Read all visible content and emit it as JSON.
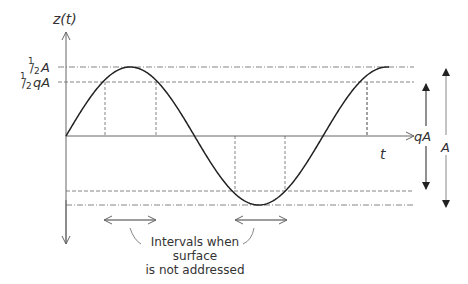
{
  "diagram": {
    "y_axis_label": "z(t)",
    "x_axis_label": "t",
    "half_a_label": {
      "frac": "1/2",
      "var": "A"
    },
    "half_qa_label": {
      "frac": "1/2",
      "var": "qA"
    },
    "qa_span_label": "qA",
    "a_span_label": "A",
    "caption_lines": [
      "Intervals when",
      "surface",
      "is not addressed"
    ],
    "colors": {
      "curve": "#222222",
      "axis": "#555555",
      "guide": "#666666"
    }
  }
}
